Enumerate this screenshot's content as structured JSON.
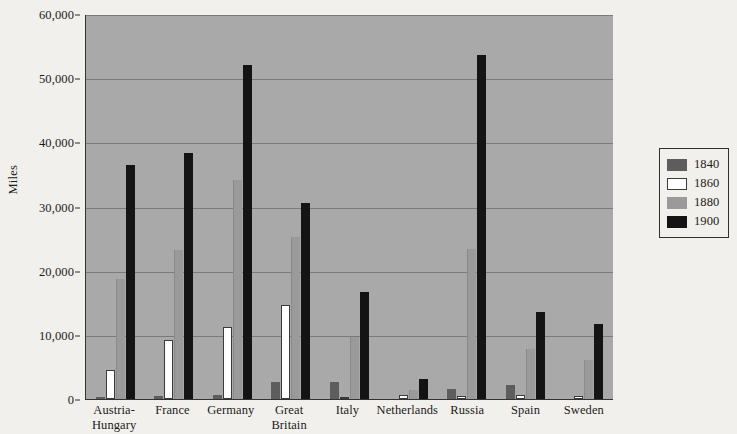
{
  "chart_data": {
    "type": "bar",
    "title": "",
    "xlabel": "",
    "ylabel": "Miles",
    "ylim": [
      0,
      60000
    ],
    "yticks": [
      0,
      10000,
      20000,
      30000,
      40000,
      50000,
      60000
    ],
    "ytick_labels": [
      "0",
      "10,000",
      "20,000",
      "30,000",
      "40,000",
      "50,000",
      "60,000"
    ],
    "grid": true,
    "legend_position": "right-outside",
    "categories": [
      "Austria-Hungary",
      "France",
      "Germany",
      "Great Britain",
      "Italy",
      "Netherlands",
      "Russia",
      "Spain",
      "Sweden"
    ],
    "category_lines": [
      [
        "Austria-",
        "Hungary"
      ],
      [
        "France"
      ],
      [
        "Germany"
      ],
      [
        "Great",
        "Britain"
      ],
      [
        "Italy"
      ],
      [
        "Netherlands"
      ],
      [
        "Russia"
      ],
      [
        "Spain"
      ],
      [
        "Sweden"
      ]
    ],
    "series": [
      {
        "name": "1840",
        "color": "#5d5d5d",
        "values": [
          300,
          500,
          600,
          2700,
          2700,
          0,
          1600,
          2200,
          0
        ]
      },
      {
        "name": "1860",
        "color": "#ffffff",
        "values": [
          4500,
          9200,
          11200,
          14700,
          200,
          700,
          400,
          700,
          400
        ]
      },
      {
        "name": "1880",
        "color": "#9a9a9a",
        "values": [
          18700,
          23300,
          34200,
          25200,
          9600,
          1400,
          23400,
          7800,
          6100
        ]
      },
      {
        "name": "1900",
        "color": "#141414",
        "values": [
          36400,
          38300,
          52000,
          30500,
          16700,
          3100,
          53600,
          13600,
          11700
        ]
      }
    ]
  },
  "legend": {
    "items": [
      {
        "label": "1840",
        "color": "#5d5d5d"
      },
      {
        "label": "1860",
        "color": "#ffffff"
      },
      {
        "label": "1880",
        "color": "#9a9a9a"
      },
      {
        "label": "1900",
        "color": "#141414"
      }
    ]
  },
  "colors": {
    "plot_background": "#a9a9a9",
    "page_background": "#f2f0ec",
    "gridline": "#7b7b7b",
    "axis": "#2b2b2b"
  }
}
